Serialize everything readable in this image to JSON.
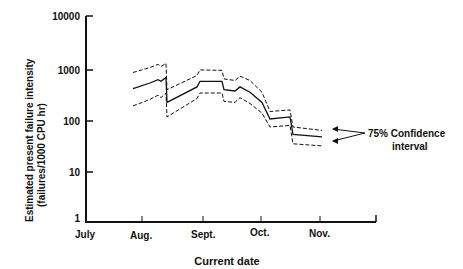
{
  "chart_data": {
    "type": "line",
    "title": "",
    "xlabel": "Current date",
    "ylabel": "Estimated present failure intensity (failures/1000 CPU hr)",
    "ylabel_lines": [
      "Estimated present failure intensity",
      "(failures/1000 CPU hr)"
    ],
    "yscale": "log",
    "ylim": [
      1,
      10000
    ],
    "y_ticks": [
      "1",
      "10",
      "100",
      "1000",
      "10000"
    ],
    "x_ticks": [
      "July",
      "Aug.",
      "Sept.",
      "Oct.",
      "Nov."
    ],
    "grid": false,
    "annotation": {
      "text_lines": [
        "75% Confidence",
        "interval"
      ],
      "points_to": [
        "upper-bound",
        "lower-bound"
      ]
    },
    "series": [
      {
        "name": "Estimate",
        "style": "solid",
        "x": [
          133,
          150,
          158,
          161,
          166,
          167,
          197,
          200,
          222,
          224,
          235,
          240,
          250,
          262,
          270,
          290,
          293,
          322
        ],
        "values": [
          390,
          500,
          580,
          540,
          640,
          210,
          420,
          540,
          540,
          370,
          350,
          420,
          330,
          210,
          100,
          110,
          50,
          45
        ]
      },
      {
        "name": "Upper 75% bound",
        "style": "dashed",
        "x": [
          133,
          150,
          158,
          161,
          166,
          167,
          197,
          200,
          222,
          224,
          235,
          240,
          250,
          262,
          270,
          290,
          293,
          322
        ],
        "values": [
          800,
          1000,
          1150,
          1050,
          1200,
          370,
          700,
          900,
          880,
          600,
          560,
          680,
          560,
          330,
          140,
          150,
          70,
          60
        ]
      },
      {
        "name": "Lower 75% bound",
        "style": "dashed",
        "x": [
          133,
          150,
          158,
          161,
          166,
          167,
          197,
          200,
          222,
          224,
          235,
          240,
          250,
          262,
          270,
          290,
          293,
          322
        ],
        "values": [
          180,
          240,
          290,
          260,
          320,
          110,
          250,
          320,
          320,
          220,
          210,
          260,
          200,
          130,
          70,
          75,
          33,
          30
        ]
      }
    ]
  }
}
